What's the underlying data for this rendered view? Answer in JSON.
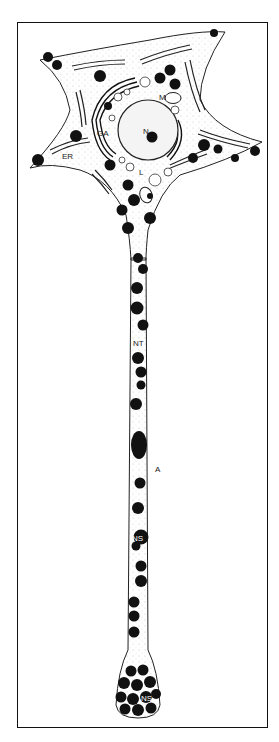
{
  "figure": {
    "labels": {
      "nucleus": "N",
      "mitochondrion": "M",
      "golgi": "GA",
      "er": "ER",
      "lysosome": "L",
      "neurotubules": "NT",
      "axon": "A",
      "ns_axon": "NS",
      "ns_terminal": "NS"
    }
  }
}
